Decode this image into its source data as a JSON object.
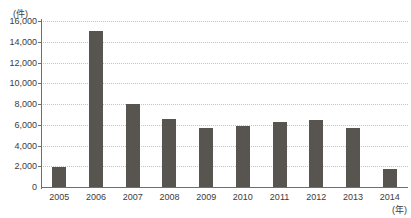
{
  "top_remnant": {
    "fragment_text": "――  ―――  ―"
  },
  "chart_data": {
    "type": "bar",
    "title": "",
    "subtitle": "",
    "xlabel": "(年)",
    "ylabel": "(件)",
    "categories": [
      "2005",
      "2006",
      "2007",
      "2008",
      "2009",
      "2010",
      "2011",
      "2012",
      "2013",
      "2014"
    ],
    "values": [
      1900,
      15000,
      8000,
      6600,
      5700,
      5900,
      6300,
      6500,
      5700,
      1750
    ],
    "ylim": [
      0,
      16000
    ],
    "ytick_step": 2000,
    "ytick_labels": [
      "16,000",
      "14,000",
      "12,000",
      "10,000",
      "8,000",
      "6,000",
      "4,000",
      "2,000",
      "0"
    ],
    "ytick_values": [
      16000,
      14000,
      12000,
      10000,
      8000,
      6000,
      4000,
      2000,
      0
    ],
    "grid": true,
    "grid_style": "dotted",
    "legend": "none",
    "bar_color": "#58544f",
    "grid_color": "#c4c4c4",
    "axis_color": "#6e6e6e",
    "background_color": "#ffffff"
  }
}
